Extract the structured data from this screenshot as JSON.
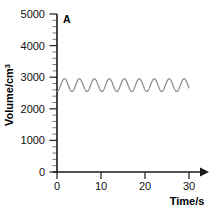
{
  "chart_data": {
    "type": "line",
    "title": "",
    "curve_label": "A",
    "xlabel": "Time/s",
    "ylabel": "Volume/cm",
    "ylabel_superscript": "3",
    "xlim": [
      0,
      33
    ],
    "ylim": [
      0,
      5000
    ],
    "xticks": [
      0,
      10,
      20,
      30
    ],
    "xtick_labels": [
      "0",
      "10",
      "20",
      "30"
    ],
    "yticks": [
      0,
      1000,
      2000,
      3000,
      4000,
      5000
    ],
    "ytick_labels": [
      "0",
      "1000",
      "2000",
      "3000",
      "4000",
      "5000"
    ],
    "y_minor_tick_interval": 200,
    "grid": false,
    "legend": "none",
    "x_axis_arrow": true,
    "series": [
      {
        "name": "A",
        "color": "#8c8c8c",
        "description": "regular tidal breathing trace",
        "baseline": 2750,
        "amplitude": 200,
        "trough": 2550,
        "peak": 2950,
        "period_s": 3.4,
        "cycles": 8.8,
        "x_start": 0,
        "x_end": 30,
        "x": [
          0,
          0.5,
          1,
          1.5,
          2,
          2.5,
          3,
          3.5,
          4,
          4.5,
          5,
          5.5,
          6,
          6.5,
          7,
          7.5,
          8,
          8.5,
          9,
          9.5,
          10,
          10.5,
          11,
          11.5,
          12,
          12.5,
          13,
          13.5,
          14,
          14.5,
          15,
          15.5,
          16,
          16.5,
          17,
          17.5,
          18,
          18.5,
          19,
          19.5,
          20,
          20.5,
          21,
          21.5,
          22,
          22.5,
          23,
          23.5,
          24,
          24.5,
          25,
          25.5,
          26,
          26.5,
          27,
          27.5,
          28,
          28.5,
          29,
          29.5,
          30
        ],
        "y": [
          2550,
          2592,
          2700,
          2838,
          2935,
          2948,
          2872,
          2742,
          2614,
          2552,
          2565,
          2658,
          2793,
          2912,
          2950,
          2903,
          2786,
          2650,
          2568,
          2550,
          2619,
          2746,
          2875,
          2947,
          2930,
          2832,
          2696,
          2585,
          2550,
          2586,
          2700,
          2838,
          2935,
          2948,
          2872,
          2742,
          2614,
          2552,
          2565,
          2658,
          2793,
          2912,
          2950,
          2903,
          2786,
          2650,
          2568,
          2550,
          2619,
          2746,
          2875,
          2947,
          2930,
          2832,
          2696,
          2585,
          2550,
          2586,
          2700,
          2838,
          2550
        ]
      }
    ]
  },
  "colors": {
    "axis": "#1a1a1a",
    "trace": "#8c8c8c",
    "text": "#000000",
    "background": "#ffffff"
  }
}
